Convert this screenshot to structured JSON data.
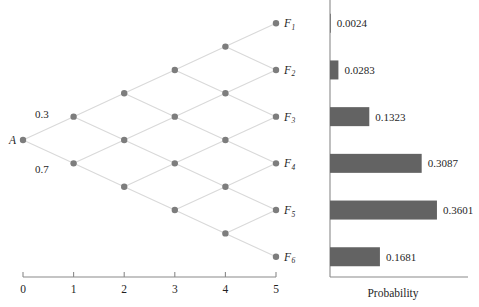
{
  "figure": {
    "background": "#ffffff",
    "node_color": "#7d7d7d",
    "edge_color": "#d9d9d9",
    "bar_color": "#636363",
    "axis_color": "#8a8a8a"
  },
  "lattice": {
    "root_label": "A",
    "branch_probabilities": [
      {
        "label": "0.3",
        "direction": "up"
      },
      {
        "label": "0.7",
        "direction": "down"
      }
    ],
    "terminal_labels": [
      "F",
      "F",
      "F",
      "F",
      "F",
      "F"
    ],
    "terminal_subscripts": [
      "1",
      "2",
      "3",
      "4",
      "5",
      "6"
    ],
    "x_axis": {
      "ticks": [
        "0",
        "1",
        "2",
        "3",
        "4",
        "5"
      ],
      "tick_values": [
        0,
        1,
        2,
        3,
        4,
        5
      ]
    },
    "steps": 5,
    "nodes_per_step": [
      1,
      2,
      3,
      4,
      5,
      6
    ]
  },
  "bars": {
    "axis_label": "Probability",
    "values": [
      "0.0024",
      "0.0283",
      "0.1323",
      "0.3087",
      "0.3601",
      "0.1681"
    ]
  },
  "chart_data": {
    "type": "bar",
    "orientation": "horizontal",
    "title": "",
    "xlabel": "Probability",
    "ylabel": "",
    "categories": [
      "F1",
      "F2",
      "F3",
      "F4",
      "F5",
      "F6"
    ],
    "values": [
      0.0024,
      0.0283,
      0.1323,
      0.3087,
      0.3601,
      0.1681
    ],
    "data_labels": [
      "0.0024",
      "0.0283",
      "0.1323",
      "0.3087",
      "0.3601",
      "0.1681"
    ],
    "xlim": [
      0,
      0.45
    ],
    "grid": false,
    "legend": null,
    "companion_diagram": {
      "type": "recombining-binomial-lattice",
      "root": "A",
      "up_probability": 0.3,
      "down_probability": 0.7,
      "steps": 5,
      "step_axis_ticks": [
        0,
        1,
        2,
        3,
        4,
        5
      ],
      "terminal_nodes": [
        "F1",
        "F2",
        "F3",
        "F4",
        "F5",
        "F6"
      ]
    }
  }
}
